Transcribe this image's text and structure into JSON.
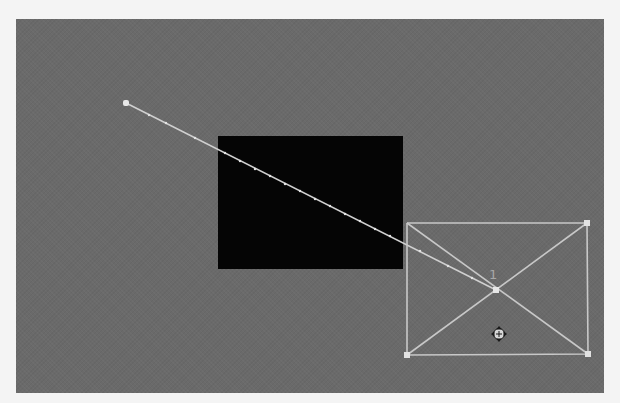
{
  "canvas": {
    "background_color": "#6a6a6a",
    "page_background": "#f4f4f4"
  },
  "layers": {
    "black_rectangle": {
      "color": "#050505"
    }
  },
  "motion_path": {
    "start_point": [
      126,
      103
    ],
    "end_point": [
      496,
      290
    ],
    "line_color": "#d0d0d0"
  },
  "selection": {
    "bounding_box": {
      "top_left": [
        407,
        223
      ],
      "top_right": [
        587,
        223
      ],
      "bottom_left": [
        407,
        355
      ],
      "bottom_right": [
        588,
        354
      ]
    },
    "anchor_point": [
      496,
      290
    ],
    "anchor_label": "1",
    "stroke_color": "#c8c8c8"
  },
  "cursor": {
    "type": "move-cursor-icon",
    "position": [
      499,
      334
    ]
  }
}
